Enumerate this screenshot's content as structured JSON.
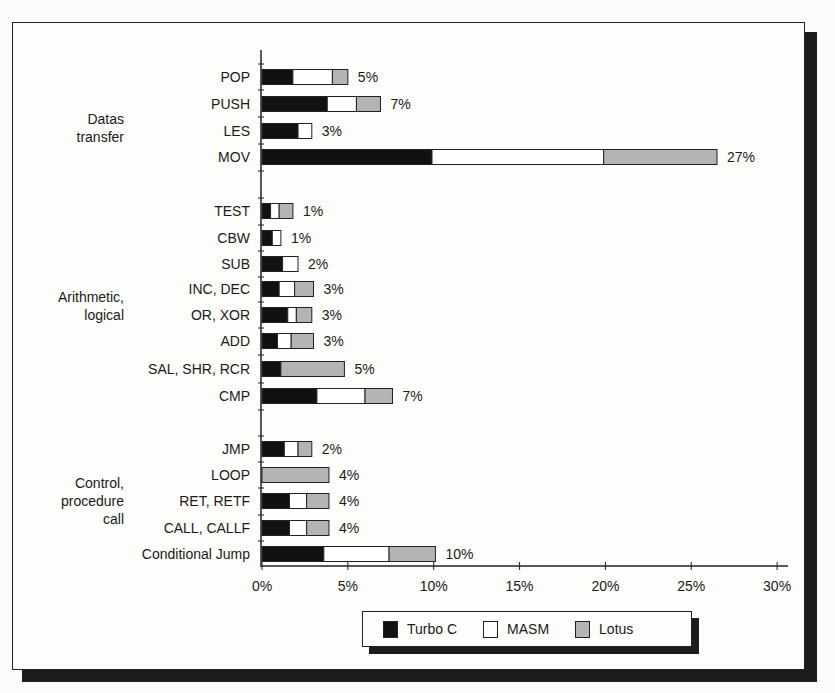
{
  "chart_data": {
    "type": "bar",
    "orientation": "horizontal",
    "stacked": true,
    "title": "",
    "xlabel": "",
    "ylabel": "",
    "xlim": [
      0,
      30
    ],
    "x_ticks": [
      "0%",
      "5%",
      "10%",
      "15%",
      "20%",
      "25%",
      "30%"
    ],
    "grid": false,
    "legend_position": "bottom-center",
    "colors": {
      "Turbo C": "#111111",
      "MASM": "#ffffff",
      "Lotus": "#b4b4b4"
    },
    "groups": [
      {
        "label": "Datas transfer",
        "label_lines": [
          "Datas",
          "transfer"
        ],
        "categories": [
          "POP",
          "PUSH",
          "LES",
          "MOV"
        ]
      },
      {
        "label": "Arithmetic, logical",
        "label_lines": [
          "Arithmetic,",
          "logical"
        ],
        "categories": [
          "TEST",
          "CBW",
          "SUB",
          "INC, DEC",
          "OR, XOR",
          "ADD",
          "SAL, SHR, RCR",
          "CMP"
        ]
      },
      {
        "label": "Control, procedure call",
        "label_lines": [
          "Control,",
          "procedure",
          "call"
        ],
        "categories": [
          "JMP",
          "LOOP",
          "RET, RETF",
          "CALL, CALLF",
          "Conditional Jump"
        ]
      }
    ],
    "categories": [
      "POP",
      "PUSH",
      "LES",
      "MOV",
      "TEST",
      "CBW",
      "SUB",
      "INC, DEC",
      "OR, XOR",
      "ADD",
      "SAL, SHR, RCR",
      "CMP",
      "JMP",
      "LOOP",
      "RET, RETF",
      "CALL, CALLF",
      "Conditional Jump"
    ],
    "series": [
      {
        "name": "Turbo C",
        "values": [
          1.8,
          3.8,
          2.1,
          9.9,
          0.5,
          0.6,
          1.2,
          1.0,
          1.5,
          0.9,
          1.1,
          3.2,
          1.3,
          0.0,
          1.6,
          1.6,
          3.6
        ]
      },
      {
        "name": "MASM",
        "values": [
          2.3,
          1.7,
          0.8,
          10.0,
          0.5,
          0.5,
          0.9,
          0.9,
          0.5,
          0.8,
          0.0,
          2.8,
          0.8,
          0.0,
          1.0,
          1.0,
          3.8
        ]
      },
      {
        "name": "Lotus",
        "values": [
          0.9,
          1.4,
          0.0,
          6.6,
          0.8,
          0.0,
          0.0,
          1.1,
          0.9,
          1.3,
          3.7,
          1.6,
          0.8,
          3.9,
          1.3,
          1.3,
          2.7
        ]
      }
    ],
    "totals_labels": [
      "5%",
      "7%",
      "3%",
      "27%",
      "1%",
      "1%",
      "2%",
      "3%",
      "3%",
      "3%",
      "5%",
      "7%",
      "2%",
      "4%",
      "4%",
      "4%",
      "10%"
    ],
    "legend": [
      "Turbo C",
      "MASM",
      "Lotus"
    ]
  }
}
